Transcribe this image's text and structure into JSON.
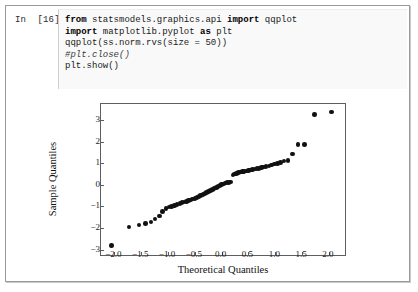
{
  "notebook": {
    "prompt_label": "In  [16]:",
    "code_lines": [
      [
        {
          "t": "from",
          "s": "kw"
        },
        {
          "t": " statsmodels.graphics.api ",
          "s": "plain"
        },
        {
          "t": "import",
          "s": "kw"
        },
        {
          "t": " qqplot",
          "s": "plain"
        }
      ],
      [
        {
          "t": "import",
          "s": "kw"
        },
        {
          "t": " matplotlib.pyplot ",
          "s": "plain"
        },
        {
          "t": "as",
          "s": "kw"
        },
        {
          "t": " plt",
          "s": "plain"
        }
      ],
      [
        {
          "t": "qqplot(ss.norm.rvs(size = 50))",
          "s": "plain"
        }
      ],
      [
        {
          "t": "#plt.close()",
          "s": "cmt"
        }
      ],
      [
        {
          "t": "plt.show()",
          "s": "plain"
        }
      ]
    ],
    "code_plain_text": "from statsmodels.graphics.api import qqplot\nimport matplotlib.pyplot as plt\nqqplot(ss.norm.rvs(size = 50))\n#plt.close()\nplt.show()"
  },
  "colors": {
    "marker": "#111111",
    "axis": "#5e5e5e",
    "cell_background": "#f9f9f9",
    "page_background": "#ffffff",
    "border": "#9a9a9a"
  },
  "chart_data": {
    "type": "scatter",
    "title": "",
    "xlabel": "Theoretical Quantiles",
    "ylabel": "Sample Quantiles",
    "xlim": [
      -2.25,
      2.3
    ],
    "ylim": [
      -3.25,
      3.75
    ],
    "xticks": [
      -2.0,
      -1.5,
      -1.0,
      -0.5,
      0.0,
      0.5,
      1.0,
      1.5,
      2.0
    ],
    "xticklabels": [
      "−2.0",
      "−1.5",
      "−1.0",
      "−0.5",
      "0.0",
      "0.5",
      "1.0",
      "1.5",
      "2.0"
    ],
    "yticks": [
      -3,
      -2,
      -1,
      0,
      1,
      2,
      3
    ],
    "yticklabels": [
      "−3",
      "−2",
      "−1",
      "0",
      "1",
      "2",
      "3"
    ],
    "grid": false,
    "legend": null,
    "series": [
      {
        "name": "sample quantiles",
        "marker": "circle",
        "color": "#111111",
        "x": [
          -2.05,
          -1.73,
          -1.54,
          -1.42,
          -1.32,
          -1.24,
          -1.16,
          -1.1,
          -1.04,
          -0.98,
          -0.93,
          -0.88,
          -0.83,
          -0.78,
          -0.74,
          -0.7,
          -0.66,
          -0.62,
          -0.58,
          -0.54,
          -0.5,
          -0.46,
          -0.42,
          -0.39,
          -0.35,
          -0.31,
          -0.28,
          -0.24,
          -0.21,
          -0.17,
          -0.14,
          -0.1,
          -0.07,
          -0.03,
          0.0,
          0.03,
          0.07,
          0.1,
          0.14,
          0.17,
          0.21,
          0.24,
          0.28,
          0.31,
          0.35,
          0.39,
          0.42,
          0.46,
          0.5,
          0.54,
          0.58,
          0.62,
          0.66,
          0.7,
          0.74,
          0.78,
          0.83,
          0.88,
          0.93,
          0.98,
          1.04,
          1.1,
          1.16,
          1.24,
          1.32,
          1.42,
          1.54,
          1.73,
          2.05
        ],
        "y": [
          -2.82,
          -1.95,
          -1.86,
          -1.8,
          -1.72,
          -1.58,
          -1.45,
          -1.22,
          -1.1,
          -1.03,
          -1.0,
          -0.96,
          -0.92,
          -0.86,
          -0.82,
          -0.79,
          -0.76,
          -0.72,
          -0.7,
          -0.66,
          -0.62,
          -0.58,
          -0.54,
          -0.48,
          -0.44,
          -0.4,
          -0.36,
          -0.31,
          -0.26,
          -0.22,
          -0.18,
          -0.13,
          -0.08,
          -0.03,
          0.02,
          0.05,
          0.08,
          0.1,
          0.12,
          0.14,
          0.46,
          0.5,
          0.54,
          0.57,
          0.59,
          0.61,
          0.63,
          0.65,
          0.67,
          0.69,
          0.71,
          0.73,
          0.75,
          0.77,
          0.8,
          0.83,
          0.86,
          0.88,
          0.92,
          0.96,
          1.0,
          1.03,
          1.1,
          1.12,
          1.44,
          1.87,
          1.88,
          3.27,
          3.38
        ]
      }
    ]
  }
}
